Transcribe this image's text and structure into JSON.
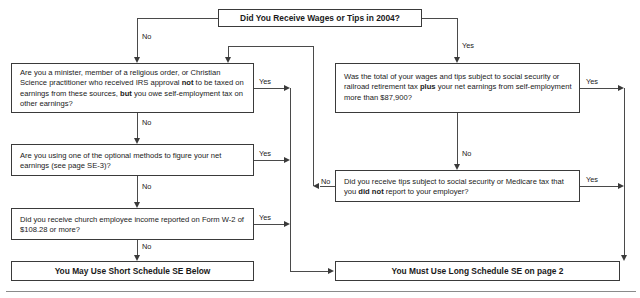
{
  "document": {
    "title": "Schedule SE (Form 1040) — Who Must File Schedule SE flowchart",
    "tax_year": "2004"
  },
  "nodes": {
    "start": {
      "id": "start-question",
      "text": "Did You Receive Wages or Tips in 2004?"
    },
    "q1": {
      "id": "minister-question",
      "part1": "Are you a minister, member of a religious order, or Christian Science practitioner who received IRS approval ",
      "bold1": "not",
      "part2": " to be taxed on earnings from these sources, ",
      "bold2": "but",
      "part3": " you owe self-employment tax on other earnings?"
    },
    "q2": {
      "id": "optional-methods-question",
      "text": "Are you using one of the optional methods to figure your net earnings (see page SE-3)?"
    },
    "q3": {
      "id": "church-income-question",
      "text": "Did you receive church employee income reported on Form W-2 of $108.28 or more?"
    },
    "q4": {
      "id": "wages-tips-threshold-question",
      "part1": "Was the total of your wages and tips subject to social security or railroad retirement tax ",
      "bold1": "plus",
      "part2": " your net earnings from self-employment more than $87,900?",
      "threshold": "$87,900"
    },
    "q5": {
      "id": "unreported-tips-question",
      "part1": "Did you receive tips subject to social security or Medicare tax that you ",
      "bold1": "did not",
      "part2": " report to your employer?"
    },
    "outcome_short": {
      "id": "short-schedule-outcome",
      "text": "You May Use Short Schedule SE Below"
    },
    "outcome_long": {
      "id": "long-schedule-outcome",
      "text": "You Must Use Long Schedule SE on page 2"
    }
  },
  "edge_labels": {
    "start_no": "No",
    "start_yes": "Yes",
    "q1_yes": "Yes",
    "q1_no": "No",
    "q2_yes": "Yes",
    "q2_no": "No",
    "q3_yes": "Yes",
    "q3_no": "No",
    "q4_yes": "Yes",
    "q4_no": "No",
    "q5_yes": "Yes",
    "q5_no": "No"
  },
  "colors": {
    "box_border": "#3a3a3a",
    "line": "#4a4a4a",
    "text": "#1a1a1a",
    "background": "#ffffff",
    "rule": "#8a8a8a"
  }
}
